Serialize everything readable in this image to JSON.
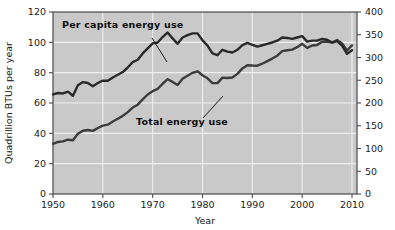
{
  "chart_data": {
    "type": "line",
    "title": "",
    "xlabel": "Year",
    "ylabel": "Quadrillion BTUs per year",
    "ylabel_right": "",
    "xlim": [
      1950,
      2011
    ],
    "ylim": [
      0,
      120
    ],
    "ylim_right": [
      0,
      400
    ],
    "grid": true,
    "legend": "inline-annotations",
    "plot_background": "#c9c9c9",
    "xticks": [
      1950,
      1960,
      1970,
      1980,
      1990,
      2000,
      2010
    ],
    "xticklabels": [
      "1950",
      "1960",
      "1970",
      "1980",
      "1990",
      "2000",
      "2010"
    ],
    "yticks": [
      0,
      20,
      40,
      60,
      80,
      100,
      120
    ],
    "yticklabels": [
      "0",
      "20",
      "40",
      "60",
      "80",
      "100",
      "120"
    ],
    "yticks_right": [
      0,
      50,
      100,
      150,
      200,
      250,
      300,
      350,
      400
    ],
    "yticklabels_right": [
      "0",
      "50",
      "100",
      "150",
      "200",
      "250",
      "300",
      "350",
      "400"
    ],
    "series": [
      {
        "name": "Total energy use",
        "axis": "left",
        "color": "#3c3c3c",
        "annotation": "Total energy use",
        "x": [
          1950,
          1951,
          1952,
          1953,
          1954,
          1955,
          1956,
          1957,
          1958,
          1959,
          1960,
          1961,
          1962,
          1963,
          1964,
          1965,
          1966,
          1967,
          1968,
          1969,
          1970,
          1971,
          1972,
          1973,
          1974,
          1975,
          1976,
          1977,
          1978,
          1979,
          1980,
          1981,
          1982,
          1983,
          1984,
          1985,
          1986,
          1987,
          1988,
          1989,
          1990,
          1991,
          1992,
          1993,
          1994,
          1995,
          1996,
          1997,
          1998,
          1999,
          2000,
          2001,
          2002,
          2003,
          2004,
          2005,
          2006,
          2007,
          2008,
          2009,
          2010
        ],
        "y": [
          33.1,
          34.3,
          34.7,
          35.8,
          35.4,
          39.7,
          41.7,
          42.2,
          41.6,
          43.5,
          45.1,
          45.7,
          47.8,
          49.6,
          51.5,
          54.0,
          57.0,
          58.9,
          62.4,
          65.6,
          67.8,
          69.3,
          72.7,
          75.7,
          73.9,
          71.9,
          76.0,
          78.0,
          79.9,
          80.9,
          78.3,
          76.3,
          73.1,
          73.1,
          76.7,
          76.5,
          76.8,
          79.2,
          82.8,
          84.9,
          84.7,
          84.6,
          85.9,
          87.6,
          89.3,
          91.2,
          94.2,
          94.8,
          95.2,
          96.8,
          99.0,
          96.3,
          97.9,
          98.2,
          100.4,
          100.5,
          99.8,
          101.5,
          99.3,
          94.6,
          98.0
        ]
      },
      {
        "name": "Per capita energy use",
        "axis": "right",
        "color": "#2a2a2a",
        "annotation": "Per capita energy use",
        "x": [
          1950,
          1951,
          1952,
          1953,
          1954,
          1955,
          1956,
          1957,
          1958,
          1959,
          1960,
          1961,
          1962,
          1963,
          1964,
          1965,
          1966,
          1967,
          1968,
          1969,
          1970,
          1971,
          1972,
          1973,
          1974,
          1975,
          1976,
          1977,
          1978,
          1979,
          1980,
          1981,
          1982,
          1983,
          1984,
          1985,
          1986,
          1987,
          1988,
          1989,
          1990,
          1991,
          1992,
          1993,
          1994,
          1995,
          1996,
          1997,
          1998,
          1999,
          2000,
          2001,
          2002,
          2003,
          2004,
          2005,
          2006,
          2007,
          2008,
          2009,
          2010
        ],
        "y": [
          219,
          222,
          221,
          225,
          216,
          239,
          246,
          244,
          237,
          244,
          249,
          249,
          256,
          262,
          268,
          278,
          290,
          295,
          309,
          320,
          331,
          333,
          345,
          355,
          342,
          330,
          344,
          349,
          353,
          353,
          338,
          326,
          309,
          305,
          317,
          313,
          311,
          317,
          327,
          332,
          328,
          324,
          327,
          330,
          333,
          337,
          344,
          343,
          341,
          344,
          347,
          335,
          337,
          337,
          341,
          339,
          333,
          336,
          326,
          308,
          316
        ]
      }
    ],
    "annotations": [
      {
        "text": "Per capita energy use",
        "x_px": 62,
        "y_px": 28
      },
      {
        "text": "Total energy use",
        "x_px": 136,
        "y_px": 125
      }
    ]
  },
  "axes": {
    "y_left_title": "Quadrillion BTUs per year",
    "x_title": "Year"
  }
}
